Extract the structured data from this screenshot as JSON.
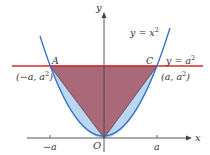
{
  "figure": {
    "colors": {
      "background": "#ffffff",
      "axis": "#444444",
      "parabola": "#2e6fc4",
      "parabola_fill": "#bcd6f2",
      "line": "#d62a2a",
      "triangle_fill": "#a8606f",
      "label": "#333333"
    },
    "axes": {
      "x_label": "x",
      "y_label": "y",
      "origin_label": "O",
      "x_ticks": [
        {
          "label": "−a",
          "x": 50
        },
        {
          "label": "a",
          "x": 157
        }
      ]
    },
    "curves": {
      "parabola_label": "y = x",
      "parabola_exp": "2",
      "line_label": "y = a",
      "line_exp": "2"
    },
    "points": {
      "A": {
        "name": "A",
        "coord": "(−a, a",
        "coord_exp": "2",
        "coord_close": ")"
      },
      "C": {
        "name": "C",
        "coord": "(a, a",
        "coord_exp": "2",
        "coord_close": ")"
      }
    }
  }
}
